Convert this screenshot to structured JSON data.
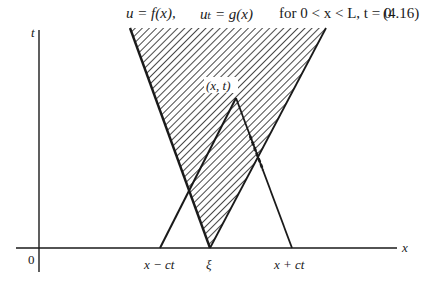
{
  "equation": {
    "part1": "u = f(x),",
    "part2": "uₜ = g(x)",
    "part3": "for 0 < x < L, t = 0",
    "number": "(4.16)"
  },
  "figure": {
    "axes": {
      "x_label": "x",
      "t_label": "t",
      "origin_label": "0"
    },
    "points": {
      "apex_label": "(x, t)",
      "left_base_label": "x − ct",
      "xi_label": "ξ",
      "right_base_label": "x + ct"
    },
    "colors": {
      "ink": "#1a1a1a",
      "background": "#ffffff"
    },
    "geometry": {
      "axis_y": 248,
      "axis_x": 39,
      "shaded_region": [
        [
          130,
          28
        ],
        [
          326,
          28
        ],
        [
          210,
          248
        ]
      ],
      "characteristic_triangle": [
        [
          160,
          248
        ],
        [
          236,
          98
        ],
        [
          292,
          248
        ]
      ]
    }
  }
}
